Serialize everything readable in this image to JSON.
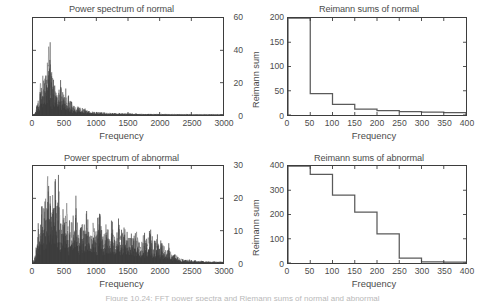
{
  "figure": {
    "caption_cut": "Figure 10.24: FFT power spectra and Riemann sums of normal and abnormal"
  },
  "panels": {
    "top_left": {
      "title": "Power spectrum of normal",
      "xlabel": "Frequency",
      "ylabel": "",
      "yticks": [
        "0",
        "20",
        "40",
        "60"
      ],
      "xticks": [
        "0",
        "500",
        "1000",
        "1500",
        "2000",
        "2500",
        "3000"
      ]
    },
    "top_right": {
      "title": "Reimann sums of normal",
      "xlabel": "Frequency",
      "ylabel": "Reimann sum",
      "yticks": [
        "0",
        "50",
        "100",
        "150",
        "200"
      ],
      "xticks": [
        "0",
        "50",
        "100",
        "150",
        "200",
        "250",
        "300",
        "350",
        "400"
      ]
    },
    "bottom_left": {
      "title": "Power spectrum of abnormal",
      "xlabel": "Frequency",
      "ylabel": "",
      "yticks": [
        "0",
        "10",
        "20",
        "30"
      ],
      "xticks": [
        "0",
        "500",
        "1000",
        "1500",
        "2000",
        "2500",
        "3000"
      ]
    },
    "bottom_right": {
      "title": "Reimann sums of abnormal",
      "xlabel": "Frequency",
      "ylabel": "Reimann sum",
      "yticks": [
        "0",
        "100",
        "200",
        "300",
        "400"
      ],
      "xticks": [
        "0",
        "50",
        "100",
        "150",
        "200",
        "250",
        "300",
        "350",
        "400"
      ]
    }
  },
  "chart_data": [
    {
      "id": "power-spectrum-normal",
      "type": "line",
      "title": "Power spectrum of normal",
      "xlabel": "Frequency",
      "ylabel": "",
      "xlim": [
        0,
        3000
      ],
      "ylim": [
        0,
        60
      ],
      "grid": false,
      "legend": null,
      "series": [
        {
          "name": "normal power spectrum",
          "color": "#3a3a3a",
          "x": [
            0,
            25,
            50,
            75,
            100,
            120,
            140,
            160,
            175,
            190,
            200,
            210,
            220,
            230,
            240,
            250,
            260,
            270,
            280,
            290,
            300,
            310,
            320,
            330,
            340,
            350,
            360,
            375,
            390,
            400,
            420,
            440,
            460,
            480,
            500,
            520,
            540,
            560,
            580,
            600,
            625,
            650,
            675,
            700,
            750,
            800,
            850,
            900,
            950,
            1000,
            1100,
            1200,
            1300,
            1400,
            1500,
            1600,
            1700,
            1800,
            1900,
            2000,
            2200,
            2400,
            2600,
            2800,
            3000
          ],
          "y": [
            0,
            1,
            3,
            10,
            6,
            22,
            14,
            27,
            18,
            33,
            21,
            39,
            24,
            48,
            30,
            50,
            27,
            44,
            20,
            38,
            16,
            31,
            21,
            26,
            14,
            24,
            11,
            19,
            9,
            17,
            12,
            21,
            10,
            16,
            8,
            14,
            7,
            12,
            6,
            9,
            5,
            7,
            4,
            5,
            4,
            3,
            3,
            2,
            2,
            2,
            1.5,
            1.2,
            1,
            1,
            0.8,
            0.8,
            0.6,
            0.6,
            0.5,
            0.5,
            0.4,
            0.4,
            0.3,
            0.3,
            0.3
          ]
        }
      ]
    },
    {
      "id": "reimann-sums-normal",
      "type": "bar",
      "title": "Reimann sums of normal",
      "xlabel": "Frequency",
      "ylabel": "Reimann sum",
      "xlim": [
        0,
        400
      ],
      "ylim": [
        0,
        200
      ],
      "grid": false,
      "legend": null,
      "note": "step/stair plot; first bin exceeds axis top and is clipped at 200",
      "bin_width": 50,
      "bin_edges": [
        0,
        50,
        100,
        150,
        200,
        250,
        300,
        350,
        400
      ],
      "values": [
        205,
        44,
        22,
        12,
        9,
        7,
        6,
        5
      ]
    },
    {
      "id": "power-spectrum-abnormal",
      "type": "line",
      "title": "Power spectrum of abnormal",
      "xlabel": "Frequency",
      "ylabel": "",
      "xlim": [
        0,
        3000
      ],
      "ylim": [
        0,
        30
      ],
      "grid": false,
      "legend": null,
      "series": [
        {
          "name": "abnormal power spectrum",
          "color": "#3a3a3a",
          "x": [
            0,
            30,
            60,
            90,
            120,
            150,
            170,
            190,
            210,
            230,
            250,
            270,
            290,
            310,
            330,
            350,
            380,
            410,
            440,
            470,
            500,
            530,
            560,
            600,
            640,
            680,
            720,
            760,
            800,
            850,
            900,
            950,
            1000,
            1050,
            1100,
            1150,
            1200,
            1250,
            1300,
            1350,
            1400,
            1450,
            1500,
            1550,
            1600,
            1650,
            1700,
            1750,
            1800,
            1850,
            1900,
            1950,
            2000,
            2050,
            2100,
            2150,
            2200,
            2250,
            2300,
            2400,
            2500,
            2600,
            2700,
            2800,
            2900,
            3000
          ],
          "y": [
            0,
            2,
            5,
            12,
            9,
            20,
            14,
            25,
            17,
            29,
            19,
            26,
            15,
            24,
            12,
            21,
            16,
            22,
            10,
            18,
            13,
            20,
            9,
            15,
            11,
            17,
            8,
            14,
            10,
            16,
            7,
            13,
            9,
            15,
            8,
            12,
            7,
            13,
            6,
            11,
            8,
            12,
            6,
            10,
            7,
            11,
            5,
            9,
            6,
            10,
            4,
            8,
            5,
            7,
            3,
            5,
            2,
            3,
            1.5,
            1,
            0.8,
            0.6,
            0.5,
            0.4,
            0.4,
            0.3
          ]
        }
      ]
    },
    {
      "id": "reimann-sums-abnormal",
      "type": "bar",
      "title": "Reimann sums of abnormal",
      "xlabel": "Frequency",
      "ylabel": "Reimann sum",
      "xlim": [
        0,
        400
      ],
      "ylim": [
        0,
        400
      ],
      "grid": false,
      "legend": null,
      "note": "step/stair plot; first bin exceeds axis top and is clipped at 400",
      "bin_width": 50,
      "bin_edges": [
        0,
        50,
        100,
        150,
        200,
        250,
        300,
        350,
        400
      ],
      "values": [
        405,
        365,
        280,
        210,
        120,
        20,
        5,
        4
      ]
    }
  ]
}
